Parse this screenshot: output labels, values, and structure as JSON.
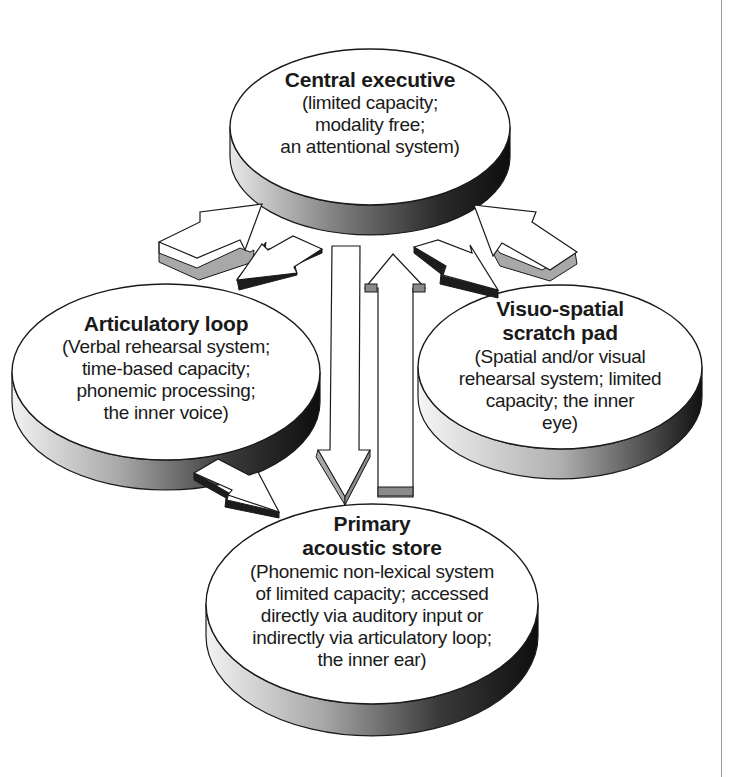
{
  "diagram": {
    "type": "working-memory-model",
    "nodes": {
      "central_executive": {
        "title": "Central executive",
        "description_lines": [
          "(limited capacity;",
          "modality free;",
          "an attentional system)"
        ]
      },
      "articulatory_loop": {
        "title": "Articulatory loop",
        "description_lines": [
          "(Verbal rehearsal system;",
          "time-based capacity;",
          "phonemic processing;",
          "the inner voice)"
        ]
      },
      "visuo_spatial": {
        "title_lines": [
          "Visuo-spatial",
          "scratch pad"
        ],
        "description_lines": [
          "(Spatial and/or visual",
          "rehearsal system; limited",
          "capacity; the inner",
          "eye)"
        ]
      },
      "primary_acoustic_store": {
        "title_lines": [
          "Primary",
          "acoustic store"
        ],
        "description_lines": [
          "(Phonemic non-lexical system",
          "of limited capacity; accessed",
          "directly via auditory input or",
          "indirectly via articulatory loop;",
          "the inner ear)"
        ]
      }
    },
    "edges": [
      {
        "from": "articulatory_loop",
        "to": "central_executive"
      },
      {
        "from": "central_executive",
        "to": "articulatory_loop"
      },
      {
        "from": "visuo_spatial",
        "to": "central_executive"
      },
      {
        "from": "central_executive",
        "to": "visuo_spatial"
      },
      {
        "from": "central_executive",
        "to": "primary_acoustic_store"
      },
      {
        "from": "primary_acoustic_store",
        "to": "central_executive"
      },
      {
        "from": "articulatory_loop",
        "to": "primary_acoustic_store"
      }
    ],
    "colors": {
      "face": "#ffffff",
      "outline": "#1a1a1a",
      "side_dark": "#1c1c1c",
      "side_mid": "#8a8a8a",
      "side_light": "#e6e6e6",
      "arrow_side": "#a8a8a8",
      "arrow_shadow": "#2a2a2a",
      "edge_line": "#9a9a9a"
    }
  }
}
